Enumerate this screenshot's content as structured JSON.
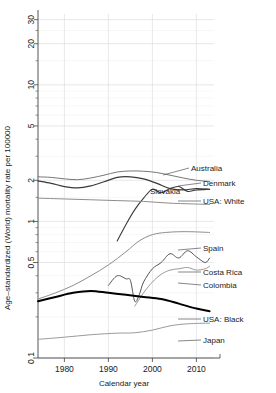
{
  "chart_data": {
    "type": "line",
    "title": "",
    "xlabel": "Calendar year",
    "ylabel": "Age–standardized (World) mortality rate per 100000",
    "xlim": [
      1974,
      2014
    ],
    "ylim": [
      0.1,
      33
    ],
    "yscale": "log",
    "grid": true,
    "legend_position": "right-inline-labels",
    "xticks": [
      1980,
      1990,
      2000,
      2010
    ],
    "xtick_labels": [
      "1980",
      "1990",
      "2000",
      "2010"
    ],
    "yticks": [
      0.1,
      0.5,
      1,
      2,
      5,
      10,
      20,
      30
    ],
    "ytick_labels": [
      "0.1",
      "0.5",
      "1",
      "2",
      "5",
      "10",
      "20",
      "30"
    ],
    "yminor_ticks": [
      0.2,
      0.3,
      0.4,
      0.6,
      0.7,
      0.8,
      0.9,
      1.5,
      3,
      4,
      6,
      7,
      8,
      9,
      15,
      25
    ],
    "series": [
      {
        "name": "Australia",
        "color": "#777777",
        "width": 1.0,
        "label": "Australia",
        "x": [
          1974,
          1977,
          1980,
          1983,
          1986,
          1989,
          1992,
          1995,
          1998,
          2001,
          2004,
          2007,
          2010,
          2013
        ],
        "values": [
          2.12,
          2.1,
          2.05,
          2.02,
          2.08,
          2.18,
          2.3,
          2.34,
          2.33,
          2.28,
          2.18,
          2.08,
          2.0,
          1.96
        ]
      },
      {
        "name": "Denmark",
        "color": "#3a3a3a",
        "width": 1.2,
        "label": "Denmark",
        "x": [
          1974,
          1977,
          1980,
          1983,
          1986,
          1989,
          1992,
          1995,
          1998,
          2001,
          2004,
          2007,
          2010,
          2013
        ],
        "values": [
          1.98,
          1.9,
          1.8,
          1.76,
          1.82,
          1.95,
          2.1,
          2.12,
          2.05,
          1.9,
          1.74,
          1.7,
          1.74,
          1.72
        ]
      },
      {
        "name": "Slovakia",
        "color": "#3a3a3a",
        "width": 1.1,
        "label": "Slovakia",
        "x": [
          1992,
          1994,
          1996,
          1998,
          2000,
          2002,
          2004,
          2006,
          2008,
          2010,
          2013
        ],
        "values": [
          0.72,
          0.95,
          1.22,
          1.48,
          1.72,
          1.62,
          1.74,
          1.8,
          1.66,
          1.7,
          1.72
        ]
      },
      {
        "name": "USA: White",
        "color": "#8d8d8d",
        "width": 1.0,
        "label": "USA: White",
        "x": [
          1974,
          1980,
          1986,
          1992,
          1998,
          2004,
          2010,
          2013
        ],
        "values": [
          1.48,
          1.46,
          1.44,
          1.42,
          1.4,
          1.36,
          1.34,
          1.33
        ]
      },
      {
        "name": "Spain",
        "color": "#8d8d8d",
        "width": 1.0,
        "label": "Spain",
        "x": [
          1974,
          1978,
          1982,
          1986,
          1990,
          1994,
          1997,
          2000,
          2003,
          2006,
          2009,
          2013
        ],
        "values": [
          0.27,
          0.3,
          0.34,
          0.4,
          0.48,
          0.6,
          0.72,
          0.8,
          0.83,
          0.84,
          0.84,
          0.83
        ]
      },
      {
        "name": "Costa Rica",
        "color": "#555555",
        "width": 1.0,
        "label": "Costa Rica",
        "x": [
          1990,
          1992,
          1994,
          1995,
          1996,
          1997,
          1998,
          2000,
          2002,
          2004,
          2006,
          2008,
          2010,
          2012,
          2013
        ],
        "values": [
          0.34,
          0.4,
          0.38,
          0.37,
          0.26,
          0.29,
          0.36,
          0.45,
          0.5,
          0.58,
          0.54,
          0.61,
          0.55,
          0.5,
          0.54
        ]
      },
      {
        "name": "Colombia",
        "color": "#9a9a9a",
        "width": 1.0,
        "label": "Colombia",
        "x": [
          1996,
          1998,
          2000,
          2002,
          2004,
          2006,
          2008,
          2010,
          2012,
          2013
        ],
        "values": [
          0.24,
          0.3,
          0.36,
          0.41,
          0.44,
          0.45,
          0.46,
          0.44,
          0.45,
          0.47
        ]
      },
      {
        "name": "USA: Black",
        "color": "#000000",
        "width": 2.0,
        "label": "USA: Black",
        "x": [
          1974,
          1978,
          1982,
          1986,
          1990,
          1994,
          1998,
          2002,
          2006,
          2010,
          2013
        ],
        "values": [
          0.26,
          0.28,
          0.3,
          0.31,
          0.3,
          0.29,
          0.28,
          0.27,
          0.25,
          0.23,
          0.22
        ]
      },
      {
        "name": "Japan",
        "color": "#9a9a9a",
        "width": 1.0,
        "label": "Japan",
        "x": [
          1974,
          1980,
          1986,
          1992,
          1996,
          2000,
          2004,
          2008,
          2013
        ],
        "values": [
          0.137,
          0.142,
          0.148,
          0.152,
          0.153,
          0.16,
          0.172,
          0.178,
          0.18
        ]
      }
    ],
    "annotations": [
      {
        "text": "Australia",
        "x": 191,
        "y": 171,
        "anchor_x": 163,
        "anchor_y": 175
      },
      {
        "text": "Denmark",
        "x": 203,
        "y": 186,
        "anchor_x": 178,
        "anchor_y": 186
      },
      {
        "text": "Slovakia",
        "x": 150,
        "y": 194,
        "anchor_x": 150,
        "anchor_y": 194
      },
      {
        "text": "USA: White",
        "x": 203,
        "y": 204,
        "anchor_x": 178,
        "anchor_y": 201
      },
      {
        "text": "Spain",
        "x": 203,
        "y": 251,
        "anchor_x": 178,
        "anchor_y": 250
      },
      {
        "text": "Costa Rica",
        "x": 203,
        "y": 275,
        "anchor_x": 178,
        "anchor_y": 272
      },
      {
        "text": "Colombia",
        "x": 203,
        "y": 288,
        "anchor_x": 178,
        "anchor_y": 283
      },
      {
        "text": "USA: Black",
        "x": 203,
        "y": 322,
        "anchor_x": 178,
        "anchor_y": 319
      },
      {
        "text": "Japan",
        "x": 203,
        "y": 343,
        "anchor_x": 178,
        "anchor_y": 341
      }
    ]
  }
}
